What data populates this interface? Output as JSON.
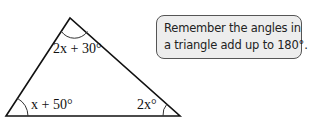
{
  "diagram": {
    "type": "triangle",
    "vertices": {
      "top": [
        70,
        18
      ],
      "bottom_left": [
        6,
        116
      ],
      "bottom_right": [
        180,
        116
      ]
    },
    "angles": {
      "top": {
        "label": "2x + 30°"
      },
      "bottom_left": {
        "label": "x + 50°"
      },
      "bottom_right": {
        "label": "2x°"
      }
    },
    "stroke_color": "#111111"
  },
  "hint": {
    "lines": [
      "Remember the angles in",
      "a triangle add up to 180°."
    ],
    "background": "#ededed",
    "border_color": "#555555"
  }
}
